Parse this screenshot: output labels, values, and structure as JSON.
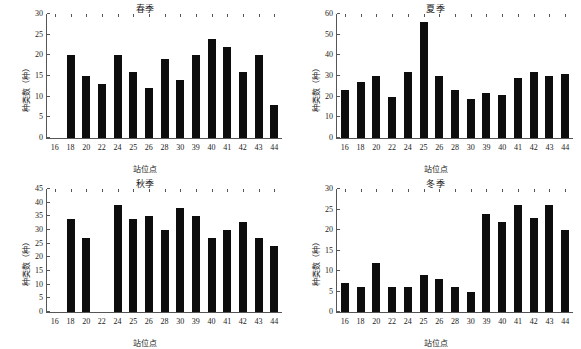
{
  "figure": {
    "categories": [
      "16",
      "18",
      "20",
      "22",
      "24",
      "25",
      "26",
      "28",
      "30",
      "39",
      "40",
      "41",
      "42",
      "43",
      "44"
    ],
    "xlabel": "站位点",
    "ylabel": "种类数（种）",
    "bar_color": "#0d0d0d",
    "axis_color": "#555555"
  },
  "chart_data": [
    {
      "type": "bar",
      "title": "春季",
      "xlabel": "站位点",
      "ylabel": "种类数（种）",
      "categories": [
        "16",
        "18",
        "20",
        "22",
        "24",
        "25",
        "26",
        "28",
        "30",
        "39",
        "40",
        "41",
        "42",
        "43",
        "44"
      ],
      "values": [
        0,
        20,
        15,
        13,
        20,
        16,
        12,
        19,
        14,
        20,
        24,
        22,
        16,
        20,
        8
      ],
      "ylim": [
        0,
        30
      ],
      "yticks": [
        0,
        5,
        10,
        15,
        20,
        25,
        30
      ],
      "grid": false,
      "legend": "none"
    },
    {
      "type": "bar",
      "title": "夏季",
      "xlabel": "站位点",
      "ylabel": "种类数（种）",
      "categories": [
        "16",
        "18",
        "20",
        "22",
        "24",
        "25",
        "26",
        "28",
        "30",
        "39",
        "40",
        "41",
        "42",
        "43",
        "44"
      ],
      "values": [
        23,
        27,
        30,
        20,
        32,
        56,
        30,
        23,
        19,
        22,
        21,
        29,
        32,
        30,
        31
      ],
      "ylim": [
        0,
        60
      ],
      "yticks": [
        0,
        10,
        20,
        30,
        40,
        50,
        60
      ],
      "grid": false,
      "legend": "none"
    },
    {
      "type": "bar",
      "title": "秋季",
      "xlabel": "站位点",
      "ylabel": "种类数（种）",
      "categories": [
        "16",
        "18",
        "20",
        "22",
        "24",
        "25",
        "26",
        "28",
        "30",
        "39",
        "40",
        "41",
        "42",
        "43",
        "44"
      ],
      "values": [
        0,
        34,
        27,
        0,
        39,
        34,
        35,
        30,
        38,
        35,
        27,
        30,
        33,
        27,
        24
      ],
      "ylim": [
        0,
        45
      ],
      "yticks": [
        0,
        5,
        10,
        15,
        20,
        25,
        30,
        35,
        40,
        45
      ],
      "grid": false,
      "legend": "none"
    },
    {
      "type": "bar",
      "title": "冬季",
      "xlabel": "站位点",
      "ylabel": "种类数（种）",
      "categories": [
        "16",
        "18",
        "20",
        "22",
        "24",
        "25",
        "26",
        "28",
        "30",
        "39",
        "40",
        "41",
        "42",
        "43",
        "44"
      ],
      "values": [
        7,
        6,
        12,
        6,
        6,
        9,
        8,
        6,
        5,
        24,
        22,
        26,
        23,
        26,
        20
      ],
      "ylim": [
        0,
        30
      ],
      "yticks": [
        0,
        5,
        10,
        15,
        20,
        25,
        30
      ],
      "grid": false,
      "legend": "none"
    }
  ]
}
